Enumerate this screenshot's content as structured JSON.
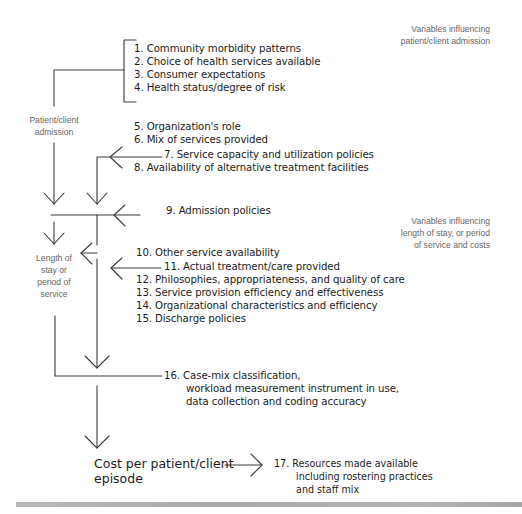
{
  "diagram": {
    "notes": {
      "admission_variables": [
        "Variables influencing",
        "patient/client admission"
      ],
      "stay_variables": [
        "Variables influencing",
        "length of stay, or period",
        "of service and costs"
      ]
    },
    "nodes": {
      "patient_admission": [
        "Patient/client",
        "admission"
      ],
      "length_of_stay": [
        "Length of",
        "stay or",
        "period of",
        "service"
      ],
      "cost": [
        "Cost per patient/client",
        "episode"
      ]
    },
    "items": [
      {
        "n": "1.",
        "text": "Community morbidity patterns"
      },
      {
        "n": "2.",
        "text": "Choice of health services available"
      },
      {
        "n": "3.",
        "text": "Consumer expectations"
      },
      {
        "n": "4.",
        "text": "Health status/degree of risk"
      },
      {
        "n": "5.",
        "text": "Organization's role"
      },
      {
        "n": "6.",
        "text": "Mix of services provided"
      },
      {
        "n": "7.",
        "text": "Service capacity and utilization policies"
      },
      {
        "n": "8.",
        "text": "Availability of alternative treatment facilities"
      },
      {
        "n": "9.",
        "text": "Admission policies"
      },
      {
        "n": "10.",
        "text": "Other service availability"
      },
      {
        "n": "11.",
        "text": "Actual treatment/care provided"
      },
      {
        "n": "12.",
        "text": "Philosophies, appropriateness, and quality of care"
      },
      {
        "n": "13.",
        "text": "Service provision efficiency and effectiveness"
      },
      {
        "n": "14.",
        "text": "Organizational characteristics and efficiency"
      },
      {
        "n": "15.",
        "text": "Discharge policies"
      }
    ],
    "item16": {
      "n": "16.",
      "lines": [
        "Case-mix classification,",
        "workload measurement instrument in use,",
        "data collection and coding accuracy"
      ]
    },
    "item17": {
      "n": "17.",
      "lines": [
        "Resources made available",
        "including rostering practices",
        "and staff mix"
      ]
    },
    "colors": {
      "line": "#3a3a3a",
      "text": "#1c1c1c",
      "note_text": "#666666",
      "footer_bar": "#b0b0b0"
    }
  }
}
